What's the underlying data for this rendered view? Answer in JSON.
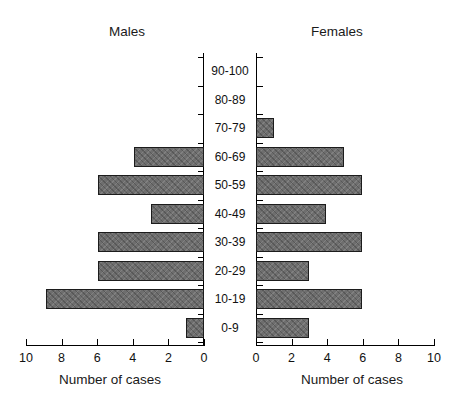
{
  "chart_data": {
    "type": "bar",
    "title": "",
    "subtitle": "",
    "orientation": "horizontal",
    "layout": "population-pyramid",
    "categories": [
      "0-9",
      "10-19",
      "20-29",
      "30-39",
      "40-49",
      "50-59",
      "60-69",
      "70-79",
      "80-89",
      "90-100"
    ],
    "category_order_top_to_bottom": [
      "90-100",
      "80-89",
      "70-79",
      "60-69",
      "50-59",
      "40-49",
      "30-39",
      "20-29",
      "10-19",
      "0-9"
    ],
    "series": [
      {
        "name": "Males",
        "side": "left",
        "values": [
          1,
          9,
          6,
          6,
          3,
          6,
          4,
          0,
          0,
          0
        ]
      },
      {
        "name": "Females",
        "side": "right",
        "values": [
          3,
          6,
          3,
          6,
          4,
          6,
          5,
          1,
          0,
          0
        ]
      }
    ],
    "xlabel": "Number of cases",
    "ylabel": "",
    "xlim": [
      0,
      10
    ],
    "left_axis_ticks": [
      10,
      8,
      6,
      4,
      2,
      0
    ],
    "right_axis_ticks": [
      0,
      2,
      4,
      6,
      8,
      10
    ],
    "grid": false,
    "legend": "none",
    "bar_color": "#6e6e6e",
    "bar_border_color": "#1c1c1c",
    "axis_color": "#000000"
  },
  "panels": {
    "males": {
      "title": "Males",
      "axis_caption": "Number of cases",
      "ticks": [
        "10",
        "8",
        "6",
        "4",
        "2",
        "0"
      ]
    },
    "females": {
      "title": "Females",
      "axis_caption": "Number of cases",
      "ticks": [
        "0",
        "2",
        "4",
        "6",
        "8",
        "10"
      ]
    }
  },
  "age_labels": [
    "90-100",
    "80-89",
    "70-79",
    "60-69",
    "50-59",
    "40-49",
    "30-39",
    "20-29",
    "10-19",
    "0-9"
  ]
}
